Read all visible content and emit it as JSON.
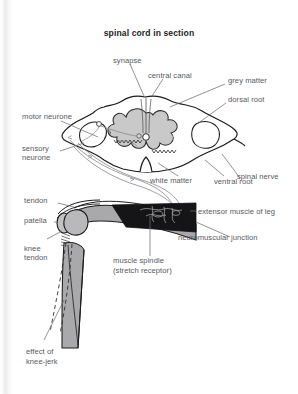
{
  "figure": {
    "title": "spinal cord in section",
    "labels": {
      "synapse": "synapse",
      "central_canal": "central canal",
      "grey_matter": "grey matter",
      "dorsal_root": "dorsal root",
      "spinal_nerve": "spinal nerve",
      "ventral_root": "ventral root",
      "white_matter": "white matter",
      "motor_neurone": "motor neurone",
      "sensory_neurone_line1": "sensory",
      "sensory_neurone_line2": "neurone",
      "tendon": "tendon",
      "patella": "patella",
      "knee_line1": "knee",
      "knee_line2": "tendon",
      "extensor_muscle": "extensor muscle of leg",
      "neuromuscular_junction": "neuromuscular junction",
      "muscle_spindle_line1": "muscle spindle",
      "muscle_spindle_line2": "(stretch receptor)",
      "effect_line1": "effect of",
      "effect_line2": "knee-jerk"
    },
    "colors": {
      "grey_matter_fill": "#c9c9ca",
      "white_matter_fill": "#ffffff",
      "muscle_fill": "#a9a9ab",
      "dark_block": "#151517",
      "outline": "#1c1c1c",
      "label_text": "#58585c",
      "title_text": "#1d1d1d",
      "leader_line": "#6e6e72",
      "page_edge": "#ececed",
      "background": "#ffffff"
    }
  }
}
